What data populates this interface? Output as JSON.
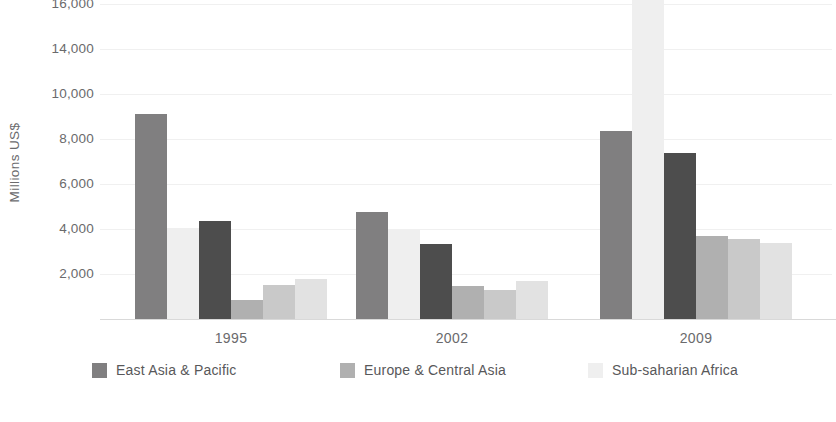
{
  "axis": {
    "y_title": "Millions US$",
    "y_ticks": [
      "16,000",
      "14,000",
      "10,000",
      "8,000",
      "6,000",
      "4,000",
      "2,000"
    ],
    "x_labels": [
      "1995",
      "2002",
      "2009"
    ]
  },
  "legend": {
    "items": [
      {
        "label": "East Asia & Pacific",
        "color": "#807f80"
      },
      {
        "label": "Europe & Central Asia",
        "color": "#b0b0b0"
      },
      {
        "label": "Sub-saharian Africa",
        "color": "#efefef"
      },
      {
        "label": "Latin America & Caribbean",
        "color": "#c9c9c9"
      },
      {
        "label": "South Asia",
        "color": "#4d4d4d"
      },
      {
        "label": "Middle East& North Africa",
        "color": "#e2e2e2"
      }
    ]
  },
  "chart_data": {
    "type": "bar",
    "title": "",
    "xlabel": "",
    "ylabel": "Millions US$",
    "categories": [
      "1995",
      "2002",
      "2009"
    ],
    "ylim": [
      0,
      16000
    ],
    "ytick_values": [
      16000,
      14000,
      10000,
      8000,
      6000,
      4000,
      2000
    ],
    "ytick_labels": [
      "16,000",
      "14,000",
      "10,000",
      "8,000",
      "6,000",
      "4,000",
      "2,000"
    ],
    "grid": true,
    "legend_position": "bottom",
    "series": [
      {
        "name": "East Asia & Pacific",
        "color": "#807f80",
        "values": [
          9100,
          4750,
          8350
        ]
      },
      {
        "name": "Sub-saharian Africa",
        "color": "#efefef",
        "values": [
          4050,
          3950,
          15500
        ]
      },
      {
        "name": "South Asia",
        "color": "#4d4d4d",
        "values": [
          4350,
          3350,
          7400
        ]
      },
      {
        "name": "Europe & Central Asia",
        "color": "#b0b0b0",
        "values": [
          850,
          1450,
          3700
        ]
      },
      {
        "name": "Latin America & Caribbean",
        "color": "#c9c9c9",
        "values": [
          1500,
          1300,
          3550
        ]
      },
      {
        "name": "Middle East& North Africa",
        "color": "#e2e2e2",
        "values": [
          1800,
          1700,
          3400
        ]
      }
    ]
  }
}
